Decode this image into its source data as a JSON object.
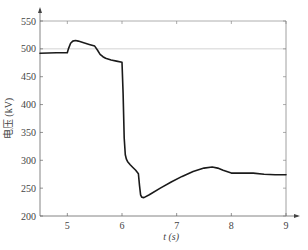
{
  "chart_data": {
    "type": "line",
    "title": "",
    "xlabel": "t (s)",
    "ylabel": "电压 (kV)",
    "xlim": [
      4.5,
      9
    ],
    "ylim": [
      200,
      550
    ],
    "xticks": [
      5,
      6,
      7,
      8,
      9
    ],
    "yticks": [
      200,
      250,
      300,
      350,
      400,
      450,
      500,
      550
    ],
    "xtick_labels": [
      "5",
      "6",
      "7",
      "8",
      "9"
    ],
    "ytick_labels": [
      "200",
      "250",
      "300",
      "350",
      "400",
      "450",
      "500",
      "550"
    ],
    "grid": false,
    "reference_lines": [
      {
        "axis": "y",
        "value": 500,
        "color": "#c8c8c8"
      },
      {
        "axis": "y",
        "value": 550,
        "color": "#999999"
      }
    ],
    "series": [
      {
        "name": "voltage",
        "color": "#1a1a1a",
        "x": [
          4.5,
          4.8,
          5.0,
          5.02,
          5.06,
          5.1,
          5.15,
          5.2,
          5.3,
          5.4,
          5.5,
          5.55,
          5.6,
          5.65,
          5.7,
          5.8,
          5.9,
          6.0,
          6.02,
          6.04,
          6.06,
          6.08,
          6.1,
          6.15,
          6.2,
          6.25,
          6.3,
          6.32,
          6.34,
          6.36,
          6.4,
          6.5,
          6.7,
          6.9,
          7.1,
          7.3,
          7.5,
          7.65,
          7.75,
          7.85,
          8.0,
          8.2,
          8.4,
          8.6,
          8.8,
          9.0
        ],
        "y": [
          492,
          493,
          493,
          500,
          510,
          514,
          515,
          514,
          511,
          508,
          505,
          498,
          490,
          486,
          483,
          480,
          478,
          476,
          420,
          340,
          310,
          302,
          298,
          292,
          287,
          282,
          276,
          255,
          238,
          234,
          233,
          238,
          250,
          261,
          271,
          280,
          286,
          288,
          286,
          282,
          277,
          277,
          277,
          275,
          274,
          274
        ]
      }
    ]
  },
  "caption": ""
}
